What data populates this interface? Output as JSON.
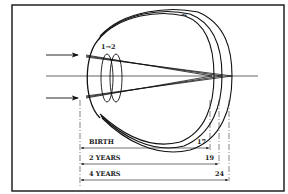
{
  "figure": {
    "lens_label": "1→2",
    "growth_mark": "→",
    "dimensions": [
      {
        "label": "BIRTH",
        "value": "17"
      },
      {
        "label": "2 YEARS",
        "value": "19"
      },
      {
        "label": "4 YEARS",
        "value": "24"
      }
    ]
  }
}
